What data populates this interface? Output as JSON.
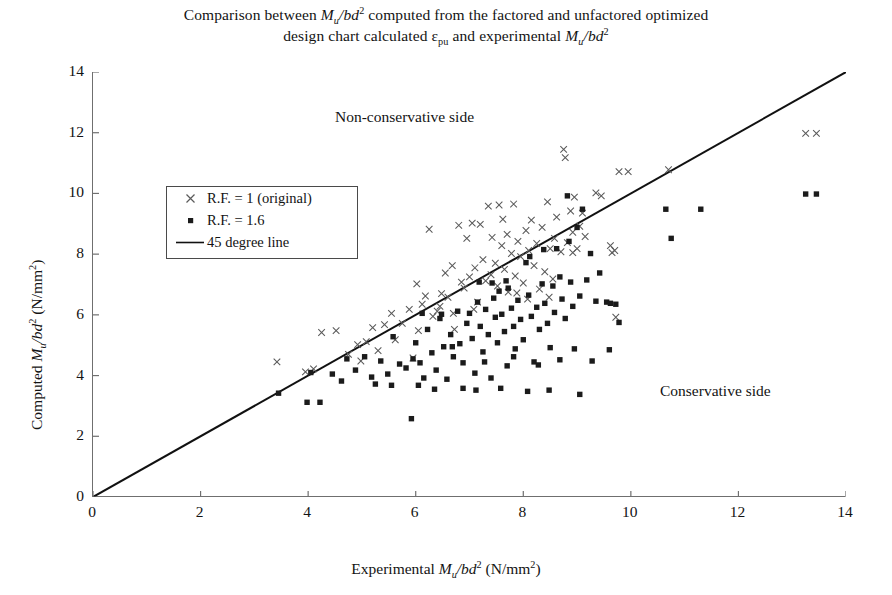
{
  "title": {
    "line1_parts": [
      "Comparison between ",
      "M",
      "u",
      "/bd",
      "2",
      " computed from the factored and unfactored optimized"
    ],
    "line1_pre": "Comparison between ",
    "line1_post": " computed from the factored and unfactored optimized",
    "line2_pre": "design chart calculated ",
    "line2_eps": "ε",
    "line2_eps_sub": "pu",
    "line2_mid": " and experimental ",
    "line2_post": "",
    "full": "Comparison between Mu/bd2 computed from the factored and unfactored optimized design chart calculated εpu and experimental Mu/bd2"
  },
  "axes": {
    "x_label_pre": "Experimental ",
    "x_label_mid": "/bd",
    "x_label_unit": " (N/mm",
    "y_label_pre": "Computed ",
    "x_label_full": "Experimental Mu/bd2 (N/mm2)",
    "y_label_full": "Computed Mu/bd2 (N/mm2)",
    "x_ticks": [
      "0",
      "2",
      "4",
      "6",
      "8",
      "10",
      "12",
      "14"
    ],
    "y_ticks": [
      "0",
      "2",
      "4",
      "6",
      "8",
      "10",
      "12",
      "14"
    ],
    "var_M": "M",
    "var_sub_u": "u",
    "exp_2": "2"
  },
  "annotations": {
    "non_conservative": "Non-conservative side",
    "conservative": "Conservative side"
  },
  "legend": {
    "items": [
      {
        "label": "R.F. = 1 (original)",
        "marker": "cross-marker",
        "color": "#555555"
      },
      {
        "label": "R.F. = 1.6",
        "marker": "square-marker",
        "color": "#1b1b1b"
      },
      {
        "label": "45 degree line",
        "marker": "line-marker",
        "color": "#111111"
      }
    ]
  },
  "colors": {
    "axis": "#6f6f6f",
    "cross": "#5a5a5a",
    "square": "#1b1b1b",
    "line": "#111111",
    "background": "#ffffff"
  },
  "chart_data": {
    "type": "scatter",
    "title": "Comparison between Mu/bd2 computed from the factored and unfactored optimized design chart calculated εpu and experimental Mu/bd2",
    "xlabel": "Experimental Mu/bd2 (N/mm2)",
    "ylabel": "Computed Mu/bd2 (N/mm2)",
    "xlim": [
      0,
      14
    ],
    "ylim": [
      0,
      14
    ],
    "xticks": [
      0,
      2,
      4,
      6,
      8,
      10,
      12,
      14
    ],
    "yticks": [
      0,
      2,
      4,
      6,
      8,
      10,
      12,
      14
    ],
    "grid": false,
    "legend_position": "upper-left-inside",
    "reference_line": {
      "name": "45 degree line",
      "from": [
        0,
        0
      ],
      "to": [
        14,
        14
      ],
      "color": "#111111",
      "width": 2.0
    },
    "annotations": [
      {
        "text": "Non-conservative side",
        "x": 4.9,
        "y": 12.45
      },
      {
        "text": "Conservative side",
        "x": 11.05,
        "y": 3.45
      }
    ],
    "series": [
      {
        "name": "R.F. = 1 (original)",
        "marker": "x",
        "color": "#5a5a5a",
        "points": [
          [
            3.42,
            4.45
          ],
          [
            3.95,
            4.12
          ],
          [
            4.1,
            4.22
          ],
          [
            4.25,
            5.42
          ],
          [
            4.52,
            5.48
          ],
          [
            4.75,
            4.7
          ],
          [
            4.92,
            5.02
          ],
          [
            5.08,
            5.12
          ],
          [
            5.2,
            5.58
          ],
          [
            5.42,
            5.68
          ],
          [
            5.55,
            6.05
          ],
          [
            5.62,
            5.18
          ],
          [
            5.75,
            5.72
          ],
          [
            5.88,
            6.18
          ],
          [
            5.95,
            4.58
          ],
          [
            6.05,
            5.48
          ],
          [
            6.12,
            6.35
          ],
          [
            6.18,
            6.62
          ],
          [
            6.25,
            8.82
          ],
          [
            6.32,
            5.95
          ],
          [
            6.4,
            6.12
          ],
          [
            6.48,
            6.7
          ],
          [
            6.55,
            7.38
          ],
          [
            6.6,
            6.58
          ],
          [
            6.68,
            7.62
          ],
          [
            6.72,
            5.52
          ],
          [
            6.8,
            8.95
          ],
          [
            6.85,
            7.08
          ],
          [
            6.9,
            6.88
          ],
          [
            6.95,
            8.52
          ],
          [
            7.0,
            7.25
          ],
          [
            7.05,
            9.02
          ],
          [
            7.1,
            7.55
          ],
          [
            7.15,
            6.42
          ],
          [
            7.2,
            8.98
          ],
          [
            7.25,
            7.82
          ],
          [
            7.3,
            7.12
          ],
          [
            7.35,
            9.58
          ],
          [
            7.4,
            7.32
          ],
          [
            7.42,
            8.55
          ],
          [
            7.48,
            7.7
          ],
          [
            7.52,
            6.95
          ],
          [
            7.55,
            9.62
          ],
          [
            7.6,
            8.28
          ],
          [
            7.65,
            7.5
          ],
          [
            7.7,
            8.65
          ],
          [
            7.72,
            6.75
          ],
          [
            7.78,
            8.02
          ],
          [
            7.82,
            9.65
          ],
          [
            7.85,
            7.28
          ],
          [
            7.9,
            8.42
          ],
          [
            7.95,
            7.92
          ],
          [
            8.0,
            7.05
          ],
          [
            8.05,
            8.78
          ],
          [
            8.1,
            8.12
          ],
          [
            8.15,
            9.12
          ],
          [
            8.2,
            7.62
          ],
          [
            8.25,
            8.35
          ],
          [
            8.3,
            6.85
          ],
          [
            8.35,
            8.88
          ],
          [
            8.4,
            7.42
          ],
          [
            8.45,
            9.72
          ],
          [
            8.5,
            8.18
          ],
          [
            8.55,
            7.18
          ],
          [
            8.58,
            8.52
          ],
          [
            8.62,
            9.22
          ],
          [
            8.7,
            8.08
          ],
          [
            8.75,
            11.45
          ],
          [
            8.78,
            11.18
          ],
          [
            8.82,
            8.38
          ],
          [
            8.88,
            9.42
          ],
          [
            8.92,
            8.72
          ],
          [
            8.95,
            9.88
          ],
          [
            9.0,
            8.18
          ],
          [
            9.05,
            8.92
          ],
          [
            9.1,
            9.35
          ],
          [
            9.35,
            10.02
          ],
          [
            9.45,
            9.92
          ],
          [
            9.62,
            8.28
          ],
          [
            9.65,
            8.05
          ],
          [
            9.7,
            8.12
          ],
          [
            9.72,
            5.92
          ],
          [
            9.78,
            10.72
          ],
          [
            9.95,
            10.72
          ],
          [
            10.7,
            10.78
          ],
          [
            13.25,
            11.98
          ],
          [
            13.45,
            11.98
          ],
          [
            4.98,
            4.48
          ],
          [
            5.3,
            4.82
          ],
          [
            6.02,
            7.02
          ],
          [
            6.45,
            6.28
          ],
          [
            7.08,
            6.18
          ],
          [
            7.62,
            9.15
          ],
          [
            8.08,
            6.52
          ],
          [
            8.48,
            6.58
          ],
          [
            9.15,
            8.58
          ],
          [
            6.7,
            6.05
          ],
          [
            7.88,
            6.72
          ],
          [
            8.92,
            8.05
          ]
        ]
      },
      {
        "name": "R.F. = 1.6",
        "marker": "s",
        "color": "#1b1b1b",
        "points": [
          [
            3.45,
            3.42
          ],
          [
            3.98,
            3.12
          ],
          [
            4.22,
            3.12
          ],
          [
            4.05,
            4.1
          ],
          [
            4.45,
            4.05
          ],
          [
            4.72,
            4.55
          ],
          [
            4.88,
            4.18
          ],
          [
            5.05,
            4.62
          ],
          [
            5.18,
            3.95
          ],
          [
            5.35,
            4.48
          ],
          [
            5.48,
            4.05
          ],
          [
            5.58,
            5.28
          ],
          [
            5.7,
            4.38
          ],
          [
            5.82,
            4.25
          ],
          [
            5.92,
            2.58
          ],
          [
            6.0,
            5.08
          ],
          [
            6.08,
            4.42
          ],
          [
            6.15,
            3.92
          ],
          [
            6.22,
            5.52
          ],
          [
            6.3,
            4.75
          ],
          [
            6.38,
            4.18
          ],
          [
            6.45,
            5.88
          ],
          [
            6.52,
            4.95
          ],
          [
            6.58,
            3.88
          ],
          [
            6.65,
            5.35
          ],
          [
            6.7,
            4.62
          ],
          [
            6.78,
            6.12
          ],
          [
            6.82,
            5.05
          ],
          [
            6.88,
            4.42
          ],
          [
            6.95,
            5.72
          ],
          [
            7.0,
            6.05
          ],
          [
            7.05,
            5.22
          ],
          [
            7.1,
            4.08
          ],
          [
            7.15,
            6.42
          ],
          [
            7.2,
            5.62
          ],
          [
            7.25,
            4.78
          ],
          [
            7.3,
            6.18
          ],
          [
            7.35,
            5.35
          ],
          [
            7.4,
            3.92
          ],
          [
            7.45,
            6.55
          ],
          [
            7.48,
            5.92
          ],
          [
            7.52,
            5.08
          ],
          [
            7.55,
            6.78
          ],
          [
            7.6,
            6.02
          ],
          [
            7.65,
            5.45
          ],
          [
            7.7,
            4.32
          ],
          [
            7.72,
            6.88
          ],
          [
            7.78,
            6.22
          ],
          [
            7.82,
            5.62
          ],
          [
            7.85,
            4.88
          ],
          [
            7.9,
            6.48
          ],
          [
            7.95,
            5.85
          ],
          [
            8.0,
            5.18
          ],
          [
            8.05,
            7.72
          ],
          [
            8.1,
            6.65
          ],
          [
            8.15,
            5.95
          ],
          [
            8.2,
            4.45
          ],
          [
            8.25,
            6.25
          ],
          [
            8.3,
            5.52
          ],
          [
            8.35,
            7.02
          ],
          [
            8.4,
            6.38
          ],
          [
            8.45,
            5.72
          ],
          [
            8.5,
            4.92
          ],
          [
            8.55,
            6.95
          ],
          [
            8.58,
            6.08
          ],
          [
            8.62,
            8.18
          ],
          [
            8.68,
            7.25
          ],
          [
            8.72,
            6.52
          ],
          [
            8.78,
            5.88
          ],
          [
            8.82,
            9.92
          ],
          [
            8.88,
            7.08
          ],
          [
            8.92,
            6.28
          ],
          [
            8.95,
            4.88
          ],
          [
            9.0,
            8.88
          ],
          [
            9.05,
            6.62
          ],
          [
            9.1,
            9.48
          ],
          [
            9.18,
            7.15
          ],
          [
            9.25,
            8.02
          ],
          [
            9.35,
            6.45
          ],
          [
            9.42,
            7.38
          ],
          [
            9.55,
            6.42
          ],
          [
            9.62,
            6.38
          ],
          [
            9.72,
            6.35
          ],
          [
            9.78,
            5.75
          ],
          [
            10.65,
            9.48
          ],
          [
            11.3,
            9.48
          ],
          [
            10.75,
            8.52
          ],
          [
            13.25,
            9.98
          ],
          [
            13.45,
            9.98
          ],
          [
            6.12,
            6.05
          ],
          [
            6.48,
            6.02
          ],
          [
            7.18,
            7.08
          ],
          [
            7.42,
            7.05
          ],
          [
            7.68,
            7.12
          ],
          [
            8.12,
            7.92
          ],
          [
            8.38,
            8.15
          ],
          [
            8.85,
            8.42
          ],
          [
            5.95,
            4.55
          ],
          [
            6.35,
            3.55
          ],
          [
            6.88,
            3.58
          ],
          [
            7.12,
            3.52
          ],
          [
            7.58,
            3.58
          ],
          [
            8.08,
            3.48
          ],
          [
            8.48,
            3.52
          ],
          [
            9.05,
            3.38
          ],
          [
            6.05,
            3.68
          ],
          [
            6.68,
            4.95
          ],
          [
            7.28,
            4.45
          ],
          [
            7.82,
            4.62
          ],
          [
            8.28,
            4.35
          ],
          [
            8.68,
            4.52
          ],
          [
            9.28,
            4.48
          ],
          [
            9.6,
            4.85
          ],
          [
            5.55,
            3.68
          ],
          [
            5.25,
            3.72
          ],
          [
            4.62,
            3.82
          ]
        ]
      }
    ]
  }
}
